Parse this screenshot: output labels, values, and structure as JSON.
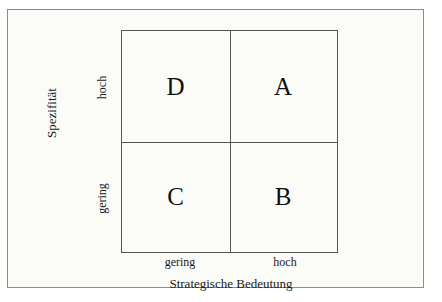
{
  "diagram": {
    "type": "2x2-matrix",
    "x_axis": {
      "title": "Strategische Bedeutung",
      "ticks": [
        "gering",
        "hoch"
      ]
    },
    "y_axis": {
      "title": "Spezifität",
      "ticks": [
        "gering",
        "hoch"
      ]
    },
    "quadrants": {
      "top_left": "D",
      "top_right": "A",
      "bottom_left": "C",
      "bottom_right": "B"
    },
    "colors": {
      "line": "#555553",
      "frame": "#8c8c88",
      "text": "#1a1a1a",
      "background": "#fbfbf8"
    }
  }
}
